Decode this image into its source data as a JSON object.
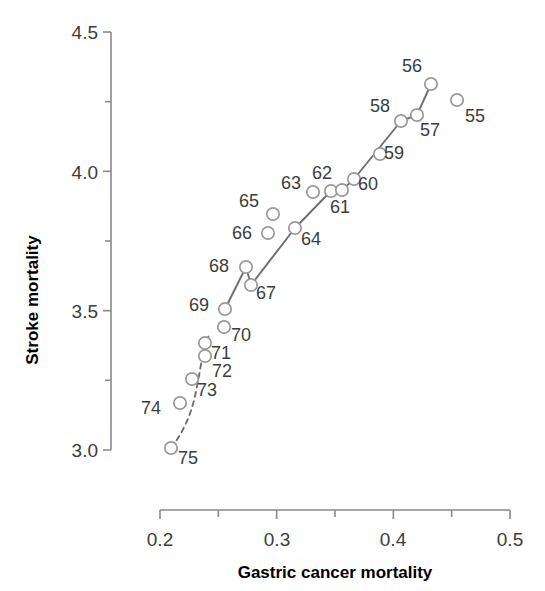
{
  "chart_data": {
    "type": "scatter",
    "title": "",
    "xlabel": "Gastric cancer mortality",
    "ylabel": "Stroke mortality",
    "xlim": [
      0.2,
      0.5
    ],
    "ylim": [
      3.0,
      4.5
    ],
    "xticks": [
      0.2,
      0.25,
      0.3,
      0.35,
      0.4,
      0.45,
      0.5
    ],
    "xtick_labels": [
      "0.2",
      "",
      "0.3",
      "",
      "0.4",
      "",
      "0.5"
    ],
    "yticks": [
      3.0,
      3.25,
      3.5,
      3.75,
      4.0,
      4.25,
      4.5
    ],
    "ytick_labels": [
      "3.0",
      "",
      "3.5",
      "",
      "4.0",
      "",
      "4.5"
    ],
    "grid": false,
    "legend": "none",
    "point_label_field": "year",
    "points": [
      {
        "year": "55",
        "x": 0.455,
        "y": 4.255,
        "px": 457,
        "py": 100,
        "lx": 475,
        "ly": 122,
        "on_line": false
      },
      {
        "year": "56",
        "x": 0.432,
        "y": 4.313,
        "px": 431,
        "py": 84,
        "lx": 412,
        "ly": 72,
        "on_line": true
      },
      {
        "year": "57",
        "x": 0.42,
        "y": 4.202,
        "px": 417,
        "py": 115,
        "lx": 430,
        "ly": 136,
        "on_line": true
      },
      {
        "year": "58",
        "x": 0.406,
        "y": 4.181,
        "px": 401,
        "py": 121,
        "lx": 380,
        "ly": 112,
        "on_line": true
      },
      {
        "year": "59",
        "x": 0.388,
        "y": 4.061,
        "px": 380,
        "py": 154,
        "lx": 394,
        "ly": 159,
        "on_line": false
      },
      {
        "year": "60",
        "x": 0.366,
        "y": 3.973,
        "px": 354,
        "py": 179,
        "lx": 368,
        "ly": 190,
        "on_line": true
      },
      {
        "year": "61",
        "x": 0.347,
        "y": 3.93,
        "px": 331,
        "py": 191,
        "lx": 340,
        "ly": 213,
        "on_line": true
      },
      {
        "year": "62",
        "x": 0.356,
        "y": 3.932,
        "px": 342,
        "py": 190,
        "lx": 322,
        "ly": 179,
        "on_line": true
      },
      {
        "year": "63",
        "x": 0.331,
        "y": 3.926,
        "px": 313,
        "py": 192,
        "lx": 291,
        "ly": 189,
        "on_line": false
      },
      {
        "year": "64",
        "x": 0.316,
        "y": 3.796,
        "px": 295,
        "py": 228,
        "lx": 311,
        "ly": 245,
        "on_line": true
      },
      {
        "year": "65",
        "x": 0.297,
        "y": 3.846,
        "px": 273,
        "py": 214,
        "lx": 249,
        "ly": 207,
        "on_line": false
      },
      {
        "year": "66",
        "x": 0.293,
        "y": 3.778,
        "px": 268,
        "py": 233,
        "lx": 242,
        "ly": 239,
        "on_line": false
      },
      {
        "year": "67",
        "x": 0.278,
        "y": 3.593,
        "px": 251,
        "py": 285,
        "lx": 266,
        "ly": 299,
        "on_line": true
      },
      {
        "year": "68",
        "x": 0.274,
        "y": 3.657,
        "px": 246,
        "py": 267,
        "lx": 219,
        "ly": 272,
        "on_line": true
      },
      {
        "year": "69",
        "x": 0.256,
        "y": 3.506,
        "px": 225,
        "py": 309,
        "lx": 199,
        "ly": 311,
        "on_line": true
      },
      {
        "year": "70",
        "x": 0.255,
        "y": 3.442,
        "px": 224,
        "py": 327,
        "lx": 241,
        "ly": 341,
        "on_line": false
      },
      {
        "year": "71",
        "x": 0.239,
        "y": 3.384,
        "px": 205,
        "py": 343,
        "lx": 221,
        "ly": 359,
        "on_line": true
      },
      {
        "year": "72",
        "x": 0.239,
        "y": 3.337,
        "px": 205,
        "py": 356,
        "lx": 222,
        "ly": 377,
        "on_line": false
      },
      {
        "year": "73",
        "x": 0.227,
        "y": 3.255,
        "px": 192,
        "py": 379,
        "lx": 207,
        "ly": 396,
        "on_line": true
      },
      {
        "year": "74",
        "x": 0.217,
        "y": 3.169,
        "px": 180,
        "py": 403,
        "lx": 151,
        "ly": 414,
        "on_line": true
      },
      {
        "year": "75",
        "x": 0.209,
        "y": 3.007,
        "px": 171,
        "py": 448,
        "lx": 188,
        "ly": 464,
        "on_line": true
      }
    ],
    "trend_solid_path": "M 225,309 L 246,267 L 251,285 L 295,228 L 331,191 L 342,190 L 354,179 L 401,121 L 417,115 L 431,84",
    "trend_dashed_path": "M 171,448 C 185,430 193,410 197,386 C 202,362 202,350 210,333",
    "colors": {
      "marker_fill": "#ffffff",
      "marker_stroke": "#9a9a9a",
      "line": "#6f6f6f",
      "axis": "#8a8a8a",
      "text": "#3d3d3d",
      "title_text": "#000000"
    }
  },
  "axes": {
    "y_title": "Stroke mortality",
    "x_title": "Gastric cancer mortality",
    "y_labels": [
      {
        "text": "4.5",
        "py": 32
      },
      {
        "text": "4.0",
        "py": 172
      },
      {
        "text": "3.5",
        "py": 311
      },
      {
        "text": "3.0",
        "py": 450
      }
    ],
    "x_labels": [
      {
        "text": "0.2",
        "px": 160
      },
      {
        "text": "0.3",
        "px": 277
      },
      {
        "text": "0.4",
        "px": 393
      },
      {
        "text": "0.5",
        "px": 510
      }
    ]
  }
}
